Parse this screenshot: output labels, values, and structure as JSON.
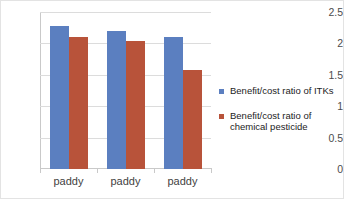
{
  "chart_data": {
    "type": "bar",
    "title": "",
    "subtitle": "",
    "xlabel": "",
    "ylabel": "",
    "categories": [
      "paddy",
      "paddy",
      "paddy"
    ],
    "series": [
      {
        "name": "Benefit/cost ratio of ITKs",
        "color": "#5b7fc0",
        "values": [
          2.27,
          2.19,
          2.11
        ]
      },
      {
        "name": "Benefit/cost ratio of\nchemical pesticide",
        "color": "#b8533a",
        "values": [
          2.1,
          2.04,
          1.57
        ]
      }
    ],
    "ylim": [
      0,
      2.5
    ],
    "ytick_values": [
      0,
      0.5,
      1,
      1.5,
      2,
      2.5
    ],
    "ytick_labels": [
      "0",
      "0.5",
      "1",
      "1.5",
      "2",
      "2.5"
    ],
    "grid": true,
    "legend_position": "right"
  },
  "legend": {
    "entries": [
      {
        "label": "Benefit/cost ratio of ITKs"
      },
      {
        "label": "Benefit/cost ratio of\nchemical pesticide"
      }
    ]
  }
}
